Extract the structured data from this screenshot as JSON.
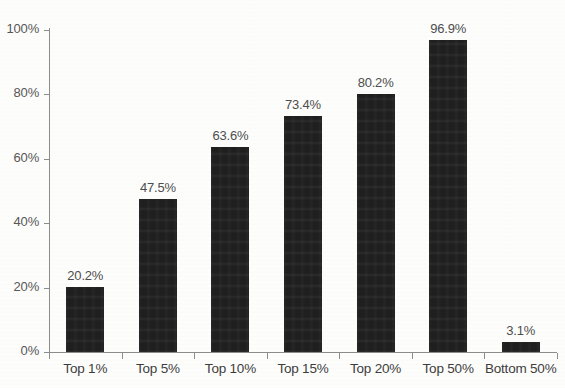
{
  "chart_data": {
    "type": "bar",
    "title": "",
    "subtitle": "",
    "xlabel": "",
    "ylabel": "",
    "categories": [
      "Top 1%",
      "Top 5%",
      "Top 10%",
      "Top 15%",
      "Top 20%",
      "Top 50%",
      "Bottom 50%"
    ],
    "values": [
      20.2,
      47.5,
      63.6,
      73.4,
      80.2,
      96.9,
      3.1
    ],
    "value_labels": [
      "20.2%",
      "47.5%",
      "63.6%",
      "73.4%",
      "80.2%",
      "96.9%",
      "3.1%"
    ],
    "ylim": [
      0,
      100
    ],
    "y_ticks": [
      0,
      20,
      40,
      60,
      80,
      100
    ],
    "y_tick_labels": [
      "0%",
      "20%",
      "40%",
      "60%",
      "80%",
      "100%"
    ],
    "grid": false,
    "legend": "none",
    "series": [
      {
        "name": "",
        "values": [
          20.2,
          47.5,
          63.6,
          73.4,
          80.2,
          96.9,
          3.1
        ]
      }
    ]
  },
  "style": {
    "bar_color": "#1f1f1f",
    "axis_color": "#8d8d8d",
    "tick_label_color": "#575757",
    "value_label_color": "#4d4d4d",
    "category_label_color": "#3d3d3d",
    "background_color": "#fdfdfc"
  }
}
